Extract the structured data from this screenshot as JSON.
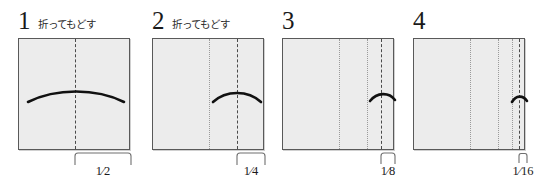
{
  "diagram": {
    "colors": {
      "sheet_fill": "#ececec",
      "sheet_border": "#595959",
      "existing_crease": "#9a9a9a",
      "new_fold_line": "#4a4a4a",
      "arrow": "#111111",
      "text": "#1a1a1a"
    },
    "steps": [
      {
        "number": "1",
        "caption": "折ってもどす",
        "fraction": "1⁄2",
        "fold_position": 0.5,
        "existing_creases": [],
        "arrow_from": 0.04,
        "arrow_to": 0.96,
        "arrow_heads": "both"
      },
      {
        "number": "2",
        "caption": "折ってもどす",
        "fraction": "1⁄4",
        "fold_position": 0.75,
        "existing_creases": [
          0.5
        ],
        "arrow_from": 0.5,
        "arrow_to": 0.99,
        "arrow_heads": "both"
      },
      {
        "number": "3",
        "caption": "",
        "fraction": "1⁄8",
        "fold_position": 0.875,
        "existing_creases": [
          0.5,
          0.75
        ],
        "arrow_from": 0.75,
        "arrow_to": 1.0,
        "arrow_heads": "both"
      },
      {
        "number": "4",
        "caption": "",
        "fraction": "1⁄16",
        "fold_position": 0.9375,
        "existing_creases": [
          0.5,
          0.75,
          0.875
        ],
        "arrow_from": 0.875,
        "arrow_to": 1.0,
        "arrow_heads": "both"
      }
    ]
  }
}
